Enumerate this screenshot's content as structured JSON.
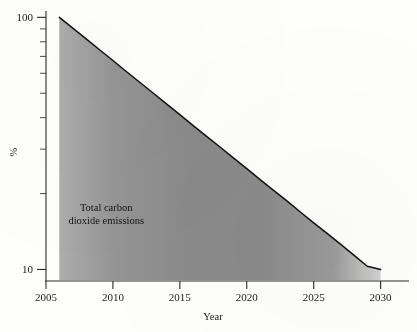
{
  "chart_data": {
    "type": "area",
    "title": "",
    "xlabel": "Year",
    "ylabel": "%",
    "yscale": "log",
    "xlim": [
      2005,
      2031
    ],
    "ylim": [
      9,
      105
    ],
    "grid": false,
    "legend": "none",
    "annotation": {
      "line1": "Total carbon",
      "line2": "dioxide emissions",
      "x": 2009.5,
      "y": 17
    },
    "x_ticks": [
      {
        "value": 2005,
        "label": "2005"
      },
      {
        "value": 2010,
        "label": "2010"
      },
      {
        "value": 2015,
        "label": "2015"
      },
      {
        "value": 2020,
        "label": "2020"
      },
      {
        "value": 2025,
        "label": "2025"
      },
      {
        "value": 2030,
        "label": "2030"
      }
    ],
    "y_ticks_major": [
      {
        "value": 100,
        "label": "100"
      },
      {
        "value": 10,
        "label": "10"
      }
    ],
    "y_ticks_minor": [
      90,
      80,
      70,
      60,
      50,
      40,
      30,
      20
    ],
    "series": [
      {
        "name": "Total carbon dioxide emissions",
        "fill_color": "#8a8a8a",
        "line_color": "#111111",
        "x": [
          2006.0,
          2007.0,
          2008.0,
          2009.0,
          2010.0,
          2011.0,
          2012.0,
          2013.0,
          2014.0,
          2015.0,
          2016.0,
          2017.0,
          2018.0,
          2019.0,
          2020.0,
          2021.0,
          2022.0,
          2023.0,
          2024.0,
          2025.0,
          2026.0,
          2027.0,
          2028.0,
          2029.0,
          2030.0
        ],
        "values": [
          100.0,
          90.6,
          82.1,
          74.4,
          67.4,
          61.0,
          55.3,
          50.1,
          45.4,
          41.1,
          37.2,
          33.7,
          30.6,
          27.7,
          25.1,
          22.7,
          20.6,
          18.7,
          16.9,
          15.3,
          13.9,
          12.6,
          11.4,
          10.3,
          10.0
        ]
      }
    ]
  },
  "colors": {
    "fill": "#8a8a8a",
    "line": "#111111",
    "axis": "#2a2a2a",
    "background": "#fefefd"
  }
}
